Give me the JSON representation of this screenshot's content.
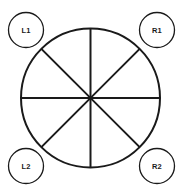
{
  "diagram": {
    "type": "sectored-circle-with-corner-nodes",
    "background_color": "#ffffff",
    "stroke_color": "#1a1a1a",
    "text_color": "#1a1a1a",
    "main_circle": {
      "name": "main-circle",
      "center_x": 90.5,
      "center_y": 98,
      "radius": 69.5,
      "stroke_width": 2,
      "fill": "none"
    },
    "spokes": {
      "count": 8,
      "diameters": 4,
      "angles_deg": [
        0,
        45,
        90,
        135,
        180,
        225,
        270,
        315
      ],
      "stroke_width": 2,
      "labels": [
        "vertical",
        "horizontal",
        "diagonal-nwse",
        "diagonal-nesw"
      ]
    },
    "corner_nodes": [
      {
        "id": "L1",
        "label": "L1",
        "position": "top-left",
        "center_x": 26,
        "center_y": 30,
        "radius": 17.5,
        "stroke_width": 1.3
      },
      {
        "id": "R1",
        "label": "R1",
        "position": "top-right",
        "center_x": 157,
        "center_y": 30,
        "radius": 17.5,
        "stroke_width": 1.3
      },
      {
        "id": "L2",
        "label": "L2",
        "position": "bottom-left",
        "center_x": 26,
        "center_y": 166,
        "radius": 17.5,
        "stroke_width": 1.3
      },
      {
        "id": "R2",
        "label": "R2",
        "position": "bottom-right",
        "center_x": 157,
        "center_y": 166,
        "radius": 17.5,
        "stroke_width": 1.3
      }
    ]
  }
}
